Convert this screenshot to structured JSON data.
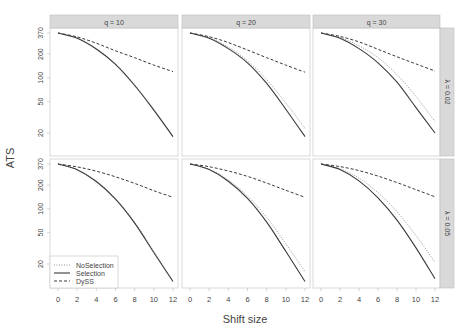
{
  "chart_data": {
    "type": "line",
    "title": "",
    "xlabel": "Shift size",
    "ylabel": "ATS",
    "y_scale": "log",
    "ylim": [
      10,
      370
    ],
    "xlim": [
      0,
      12
    ],
    "x_ticks": [
      0,
      2,
      4,
      6,
      8,
      10,
      12
    ],
    "y_ticks": [
      370,
      200,
      100,
      50,
      20
    ],
    "grid": false,
    "legend": {
      "position": "inside bottom-left (lower-left panel)",
      "entries": [
        "NoSelection",
        "Selection",
        "DySS"
      ]
    },
    "col_facets": [
      "q = 10",
      "q = 20",
      "q = 30"
    ],
    "row_facets": [
      "λ = 0.02",
      "λ = 0.05"
    ],
    "x": [
      0,
      2,
      4,
      6,
      8,
      10,
      12
    ],
    "panels": [
      {
        "row": "λ = 0.02",
        "col": "q = 10",
        "series": [
          {
            "name": "NoSelection",
            "style": "dotted",
            "values": [
              370,
              320,
              235,
              150,
              82,
              40,
              18
            ]
          },
          {
            "name": "Selection",
            "style": "solid",
            "values": [
              370,
              318,
              232,
              148,
              80,
              39,
              18
            ]
          },
          {
            "name": "DySS",
            "style": "dashed",
            "values": [
              370,
              330,
              275,
              220,
              180,
              145,
              120
            ]
          }
        ]
      },
      {
        "row": "λ = 0.02",
        "col": "q = 20",
        "series": [
          {
            "name": "NoSelection",
            "style": "dotted",
            "values": [
              370,
              322,
              245,
              165,
              95,
              48,
              23
            ]
          },
          {
            "name": "Selection",
            "style": "solid",
            "values": [
              370,
              318,
              235,
              155,
              85,
              40,
              18
            ]
          },
          {
            "name": "DySS",
            "style": "dashed",
            "values": [
              370,
              332,
              280,
              225,
              180,
              145,
              118
            ]
          }
        ]
      },
      {
        "row": "λ = 0.02",
        "col": "q = 30",
        "series": [
          {
            "name": "NoSelection",
            "style": "dotted",
            "values": [
              370,
              325,
              255,
              180,
              110,
              58,
              28
            ]
          },
          {
            "name": "Selection",
            "style": "solid",
            "values": [
              370,
              318,
              235,
              155,
              88,
              42,
              20
            ]
          },
          {
            "name": "DySS",
            "style": "dashed",
            "values": [
              370,
              335,
              285,
              230,
              185,
              150,
              122
            ]
          }
        ]
      },
      {
        "row": "λ = 0.05",
        "col": "q = 10",
        "series": [
          {
            "name": "NoSelection",
            "style": "dotted",
            "values": [
              370,
              315,
              225,
              135,
              68,
              29,
              12
            ]
          },
          {
            "name": "Selection",
            "style": "solid",
            "values": [
              370,
              313,
              222,
              133,
              66,
              28,
              12
            ]
          },
          {
            "name": "DySS",
            "style": "dashed",
            "values": [
              370,
              340,
              300,
              255,
              210,
              170,
              140
            ]
          }
        ]
      },
      {
        "row": "λ = 0.05",
        "col": "q = 20",
        "series": [
          {
            "name": "NoSelection",
            "style": "dotted",
            "values": [
              370,
              318,
              232,
              145,
              78,
              36,
              16
            ]
          },
          {
            "name": "Selection",
            "style": "solid",
            "values": [
              370,
              314,
              224,
              136,
              68,
              29,
              12
            ]
          },
          {
            "name": "DySS",
            "style": "dashed",
            "values": [
              370,
              342,
              302,
              258,
              212,
              172,
              140
            ]
          }
        ]
      },
      {
        "row": "λ = 0.05",
        "col": "q = 30",
        "series": [
          {
            "name": "NoSelection",
            "style": "dotted",
            "values": [
              370,
              322,
              245,
              160,
              92,
              46,
              21
            ]
          },
          {
            "name": "Selection",
            "style": "solid",
            "values": [
              370,
              315,
              226,
              138,
              72,
              32,
              13
            ]
          },
          {
            "name": "DySS",
            "style": "dashed",
            "values": [
              370,
              343,
              305,
              260,
              215,
              175,
              142
            ]
          }
        ]
      }
    ]
  },
  "axis_labels": {
    "x": "Shift size",
    "y": "ATS"
  },
  "legend_labels": [
    "NoSelection",
    "Selection",
    "DySS"
  ],
  "colors": {
    "strip": "#d9d9d9",
    "line": "#3a3a3a",
    "nosel": "#8a8a8a",
    "border": "#cfcfcf",
    "text": "#444444"
  }
}
